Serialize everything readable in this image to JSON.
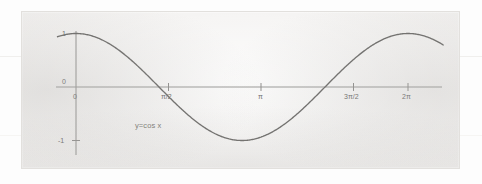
{
  "figure": {
    "caption_label": "y=cos x",
    "background_color": "#eceae8",
    "curve_color": "#6b6a68",
    "axis_color": "#8e8d8b",
    "text_color": "#6d6c6a"
  },
  "chart_data": {
    "type": "line",
    "title": "",
    "subtitle": "",
    "xlabel": "",
    "ylabel": "",
    "annotations": [
      "y=cos x"
    ],
    "legend": [],
    "legend_position": "none",
    "grid": false,
    "xlim": [
      -0.35,
      6.95
    ],
    "ylim": [
      -1.45,
      1.35
    ],
    "x_tick_values": [
      0,
      1.5707963,
      3.1415927,
      4.712389,
      6.2831853
    ],
    "x_tick_labels": [
      "0",
      "π/2",
      "π",
      "3π/2",
      "2π"
    ],
    "y_tick_values": [
      1,
      0,
      -1
    ],
    "y_tick_labels": [
      "1",
      "0",
      "-1"
    ],
    "series": [
      {
        "name": "y=cos x",
        "color": "#6b6a68",
        "expression": "y = cos(x)",
        "x": [
          -0.35,
          -0.2,
          0,
          0.2,
          0.4,
          0.6,
          0.8,
          1.0,
          1.2,
          1.4,
          1.5707963,
          1.8,
          2.0,
          2.2,
          2.4,
          2.6,
          2.8,
          3.0,
          3.1415927,
          3.3,
          3.5,
          3.7,
          3.9,
          4.1,
          4.3,
          4.5,
          4.712389,
          4.9,
          5.1,
          5.3,
          5.5,
          5.7,
          5.9,
          6.1,
          6.2831853,
          6.5,
          6.7,
          6.95
        ],
        "y": [
          0.939,
          0.98,
          1.0,
          0.98,
          0.921,
          0.825,
          0.697,
          0.54,
          0.362,
          0.17,
          0.0,
          -0.227,
          -0.416,
          -0.589,
          -0.737,
          -0.857,
          -0.942,
          -0.99,
          -1.0,
          -0.987,
          -0.936,
          -0.848,
          -0.726,
          -0.575,
          -0.401,
          -0.211,
          0.0,
          0.187,
          0.378,
          0.555,
          0.709,
          0.835,
          0.927,
          0.983,
          1.0,
          0.977,
          0.913,
          0.795
        ]
      }
    ]
  },
  "axes": {
    "y_ticks": [
      {
        "label": "1",
        "value": 1
      },
      {
        "label": "0",
        "value": 0
      },
      {
        "label": "-1",
        "value": -1
      }
    ],
    "x_ticks": [
      {
        "label": "0",
        "value": 0
      },
      {
        "label": "π/2",
        "value": 1.5707963
      },
      {
        "label": "π",
        "value": 3.1415927
      },
      {
        "label": "3π/2",
        "value": 4.712389
      },
      {
        "label": "2π",
        "value": 6.2831853
      }
    ]
  }
}
